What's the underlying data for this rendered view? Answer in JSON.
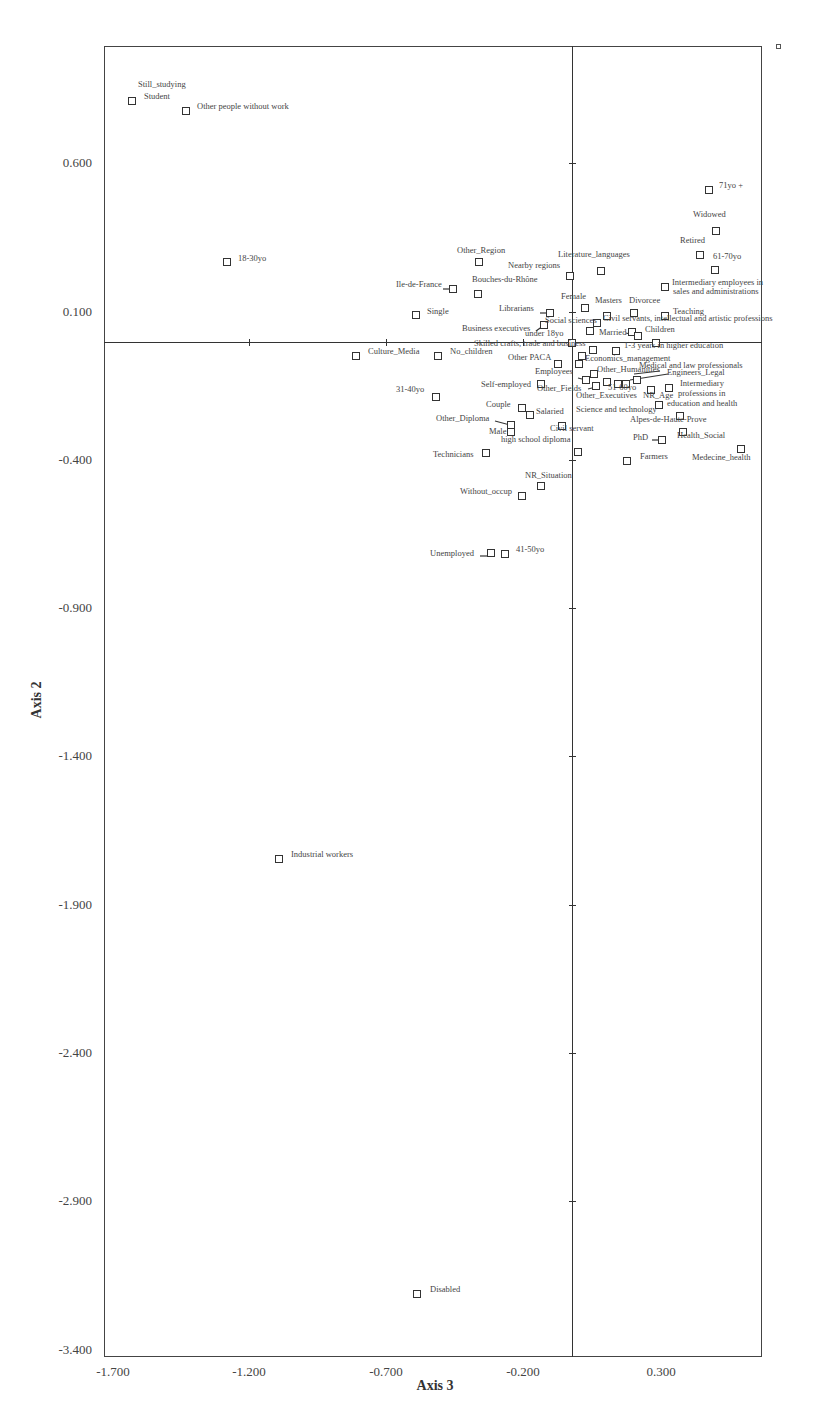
{
  "chart_data": {
    "type": "scatter",
    "title": "",
    "xlabel": "Axis 3",
    "ylabel": "Axis 2",
    "xlim": [
      -1.7,
      0.72
    ],
    "ylim": [
      -3.4,
      1.0
    ],
    "grid": false,
    "legend_position": "none",
    "x_ticks": [
      "-1.700",
      "-1.200",
      "-0.700",
      "-0.200",
      "0.300"
    ],
    "y_ticks": [
      "0.600",
      "0.100",
      "-0.400",
      "-0.900",
      "-1.400",
      "-1.900",
      "-2.400",
      "-2.900",
      "-3.400"
    ],
    "points": [
      {
        "label": "Still_studying",
        "x": -1.62,
        "y": 0.81
      },
      {
        "label": "Student",
        "x": -1.62,
        "y": 0.81
      },
      {
        "label": "Other people without work",
        "x": -1.42,
        "y": 0.77
      },
      {
        "label": "18-30yo",
        "x": -1.26,
        "y": 0.27
      },
      {
        "label": "71yo +",
        "x": 0.53,
        "y": 0.51
      },
      {
        "label": "Widowed",
        "x": 0.55,
        "y": 0.38
      },
      {
        "label": "Retired",
        "x": 0.5,
        "y": 0.29
      },
      {
        "label": "61-70yo",
        "x": 0.55,
        "y": 0.24
      },
      {
        "label": "Intermediary employees in sales and administrations",
        "x": 0.35,
        "y": 0.19
      },
      {
        "label": "Literature_languages",
        "x": 0.1,
        "y": 0.24
      },
      {
        "label": "Nearby regions",
        "x": -0.01,
        "y": 0.22
      },
      {
        "label": "Other_Region",
        "x": -0.35,
        "y": 0.27
      },
      {
        "label": "Ile-de-France",
        "x": -0.45,
        "y": 0.18
      },
      {
        "label": "Bouches-du-Rhône",
        "x": -0.35,
        "y": 0.16
      },
      {
        "label": "Single",
        "x": -0.59,
        "y": 0.09
      },
      {
        "label": "Librarians",
        "x": -0.09,
        "y": 0.1
      },
      {
        "label": "Female",
        "x": 0.04,
        "y": 0.12
      },
      {
        "label": "Masters",
        "x": 0.12,
        "y": 0.09
      },
      {
        "label": "Divorcee",
        "x": 0.23,
        "y": 0.1
      },
      {
        "label": "Teaching",
        "x": 0.35,
        "y": 0.09
      },
      {
        "label": "Social sciences",
        "x": -0.11,
        "y": 0.06
      },
      {
        "label": "Civil servants, intellectual and artistic professions",
        "x": 0.09,
        "y": 0.06
      },
      {
        "label": "Business executives",
        "x": -0.13,
        "y": 0.03
      },
      {
        "label": "under 18yo",
        "x": -0.01,
        "y": 0.0
      },
      {
        "label": "Married",
        "x": 0.07,
        "y": 0.04
      },
      {
        "label": "Children",
        "x": 0.23,
        "y": 0.03
      },
      {
        "label": "Skilled crafts, trade and business",
        "x": -0.01,
        "y": -0.01
      },
      {
        "label": "1-3 years in higher education",
        "x": 0.16,
        "y": -0.03
      },
      {
        "label": "Culture_Media",
        "x": -0.81,
        "y": -0.05
      },
      {
        "label": "No_children",
        "x": -0.5,
        "y": -0.05
      },
      {
        "label": "Other PACA",
        "x": -0.05,
        "y": -0.08
      },
      {
        "label": "Economics_management",
        "x": 0.03,
        "y": -0.08
      },
      {
        "label": "Employees",
        "x": 0.04,
        "y": -0.13
      },
      {
        "label": "Other_Humanities",
        "x": 0.08,
        "y": -0.11
      },
      {
        "label": "Medical and law professionals",
        "x": 0.25,
        "y": -0.12
      },
      {
        "label": "Engineers_Legal",
        "x": 0.24,
        "y": -0.14
      },
      {
        "label": "51-60yo",
        "x": 0.17,
        "y": -0.14
      },
      {
        "label": "Other_Fields",
        "x": 0.09,
        "y": -0.15
      },
      {
        "label": "Self-employed",
        "x": -0.11,
        "y": -0.14
      },
      {
        "label": "Other_Executives",
        "x": 0.13,
        "y": -0.14
      },
      {
        "label": "NR_Age",
        "x": 0.3,
        "y": -0.16
      },
      {
        "label": "Intermediary professions in education and health",
        "x": 0.37,
        "y": -0.15
      },
      {
        "label": "31-40yo",
        "x": -0.52,
        "y": -0.19
      },
      {
        "label": "Couple",
        "x": -0.18,
        "y": -0.22
      },
      {
        "label": "Salaried",
        "x": -0.15,
        "y": -0.24
      },
      {
        "label": "Science and technology",
        "x": 0.32,
        "y": -0.2
      },
      {
        "label": "Alpes-de-Haute-Prove",
        "x": 0.4,
        "y": -0.25
      },
      {
        "label": "Other_Diploma",
        "x": -0.22,
        "y": -0.27
      },
      {
        "label": "Male",
        "x": -0.22,
        "y": -0.3
      },
      {
        "label": "Civil servant",
        "x": -0.04,
        "y": -0.28
      },
      {
        "label": "high school diploma",
        "x": -0.22,
        "y": -0.3
      },
      {
        "label": "PhD",
        "x": 0.33,
        "y": -0.33
      },
      {
        "label": "Health_Social",
        "x": 0.41,
        "y": -0.31
      },
      {
        "label": "Medecine_health",
        "x": 0.62,
        "y": -0.36
      },
      {
        "label": "Technicians",
        "x": -0.32,
        "y": -0.37
      },
      {
        "label": "Farmers",
        "x": 0.2,
        "y": -0.4
      },
      {
        "label": "NR_Situation",
        "x": -0.11,
        "y": -0.48
      },
      {
        "label": "Without_occup",
        "x": -0.18,
        "y": -0.52
      },
      {
        "label": "Unemployed",
        "x": -0.3,
        "y": -0.72
      },
      {
        "label": "41-50yo",
        "x": -0.25,
        "y": -0.72
      },
      {
        "label": "Industrial workers",
        "x": -1.09,
        "y": -1.71
      },
      {
        "label": "Disabled",
        "x": -0.59,
        "y": -3.17
      }
    ]
  },
  "axes": {
    "x_title": "Axis 3",
    "y_title": "Axis 2",
    "x_ticks": [
      {
        "label": "-1.700",
        "px": 113
      },
      {
        "label": "-1.200",
        "px": 249
      },
      {
        "label": "-0.700",
        "px": 386
      },
      {
        "label": "-0.200",
        "px": 523
      },
      {
        "label": "0.300",
        "px": 661
      }
    ],
    "y_ticks": [
      {
        "label": "0.600",
        "py": 163
      },
      {
        "label": "0.100",
        "py": 312
      },
      {
        "label": "-0.400",
        "py": 460
      },
      {
        "label": "-0.900",
        "py": 608
      },
      {
        "label": "-1.400",
        "py": 756
      },
      {
        "label": "-1.900",
        "py": 905
      },
      {
        "label": "-2.400",
        "py": 1053
      },
      {
        "label": "-2.900",
        "py": 1201
      },
      {
        "label": "-3.400",
        "py": 1350
      }
    ]
  },
  "markers": [
    {
      "name": "student",
      "px": 132,
      "py": 101
    },
    {
      "name": "other-people-without-work",
      "px": 186,
      "py": 111
    },
    {
      "name": "18-30yo",
      "px": 227,
      "py": 262
    },
    {
      "name": "71yo",
      "px": 709,
      "py": 190
    },
    {
      "name": "widowed",
      "px": 716,
      "py": 231
    },
    {
      "name": "retired",
      "px": 700,
      "py": 255
    },
    {
      "name": "61-70yo",
      "px": 715,
      "py": 270
    },
    {
      "name": "intermediary-employees",
      "px": 665,
      "py": 287
    },
    {
      "name": "literature-languages",
      "px": 601,
      "py": 271
    },
    {
      "name": "nearby-regions",
      "px": 570,
      "py": 276
    },
    {
      "name": "other-region",
      "px": 479,
      "py": 262
    },
    {
      "name": "ile-de-france",
      "px": 453,
      "py": 289
    },
    {
      "name": "bouches-du-rhone",
      "px": 478,
      "py": 294
    },
    {
      "name": "single",
      "px": 416,
      "py": 315
    },
    {
      "name": "librarians",
      "px": 550,
      "py": 313
    },
    {
      "name": "female",
      "px": 585,
      "py": 308
    },
    {
      "name": "masters",
      "px": 607,
      "py": 316
    },
    {
      "name": "divorcee",
      "px": 634,
      "py": 313
    },
    {
      "name": "teaching",
      "px": 665,
      "py": 316
    },
    {
      "name": "social-sciences",
      "px": 544,
      "py": 325
    },
    {
      "name": "civil-servants-intellectual",
      "px": 597,
      "py": 323
    },
    {
      "name": "civil-servants-2",
      "px": 590,
      "py": 331
    },
    {
      "name": "married",
      "px": 632,
      "py": 332
    },
    {
      "name": "children",
      "px": 638,
      "py": 336
    },
    {
      "name": "under-18yo",
      "px": 572,
      "py": 343
    },
    {
      "name": "skilled-crafts",
      "px": 593,
      "py": 350
    },
    {
      "name": "1-3-years",
      "px": 616,
      "py": 351
    },
    {
      "name": "children-2",
      "px": 656,
      "py": 343
    },
    {
      "name": "culture-media",
      "px": 356,
      "py": 356
    },
    {
      "name": "no-children",
      "px": 438,
      "py": 356
    },
    {
      "name": "economics-management",
      "px": 582,
      "py": 356
    },
    {
      "name": "other-paca",
      "px": 558,
      "py": 364
    },
    {
      "name": "economics-2",
      "px": 579,
      "py": 364
    },
    {
      "name": "other-humanities",
      "px": 594,
      "py": 374
    },
    {
      "name": "employees",
      "px": 586,
      "py": 380
    },
    {
      "name": "other-fields",
      "px": 596,
      "py": 386
    },
    {
      "name": "51-60yo-a",
      "px": 607,
      "py": 382
    },
    {
      "name": "51-60yo-b",
      "px": 618,
      "py": 384
    },
    {
      "name": "51-60yo-c",
      "px": 626,
      "py": 384
    },
    {
      "name": "engineers-legal",
      "px": 637,
      "py": 380
    },
    {
      "name": "self-employed",
      "px": 541,
      "py": 384
    },
    {
      "name": "nr-age",
      "px": 651,
      "py": 390
    },
    {
      "name": "intermediary-professions",
      "px": 669,
      "py": 388
    },
    {
      "name": "science-technology",
      "px": 659,
      "py": 405
    },
    {
      "name": "alpes-de-haute-provence",
      "px": 680,
      "py": 416
    },
    {
      "name": "31-40yo",
      "px": 436,
      "py": 397
    },
    {
      "name": "couple",
      "px": 522,
      "py": 408
    },
    {
      "name": "salaried",
      "px": 530,
      "py": 415
    },
    {
      "name": "other-diploma",
      "px": 511,
      "py": 425
    },
    {
      "name": "male",
      "px": 511,
      "py": 432
    },
    {
      "name": "civil-servant",
      "px": 562,
      "py": 426
    },
    {
      "name": "health-social",
      "px": 683,
      "py": 432
    },
    {
      "name": "phd",
      "px": 662,
      "py": 440
    },
    {
      "name": "medecine-health",
      "px": 741,
      "py": 449
    },
    {
      "name": "technicians",
      "px": 486,
      "py": 453
    },
    {
      "name": "high-school-diploma",
      "px": 578,
      "py": 452
    },
    {
      "name": "farmers",
      "px": 627,
      "py": 461
    },
    {
      "name": "nr-situation",
      "px": 541,
      "py": 486
    },
    {
      "name": "without-occup",
      "px": 522,
      "py": 496
    },
    {
      "name": "unemployed",
      "px": 491,
      "py": 553
    },
    {
      "name": "41-50yo",
      "px": 505,
      "py": 554
    },
    {
      "name": "industrial-workers",
      "px": 279,
      "py": 859
    },
    {
      "name": "disabled",
      "px": 417,
      "py": 1294
    }
  ],
  "labels": [
    {
      "text": "Still_studying",
      "px": 138,
      "py": 84
    },
    {
      "text": "Student",
      "px": 144,
      "py": 96
    },
    {
      "text": "Other people without work",
      "px": 197,
      "py": 106
    },
    {
      "text": "18-30yo",
      "px": 238,
      "py": 258
    },
    {
      "text": "71yo +",
      "px": 719,
      "py": 185
    },
    {
      "text": "Widowed",
      "px": 693,
      "py": 214
    },
    {
      "text": "Retired",
      "px": 680,
      "py": 240
    },
    {
      "text": "61-70yo",
      "px": 713,
      "py": 256
    },
    {
      "text": "Intermediary employees in",
      "px": 672,
      "py": 282
    },
    {
      "text": "sales and administrations",
      "px": 673,
      "py": 291
    },
    {
      "text": "Literature_languages",
      "px": 558,
      "py": 254
    },
    {
      "text": "Nearby regions",
      "px": 508,
      "py": 265
    },
    {
      "text": "Other_Region",
      "px": 457,
      "py": 250
    },
    {
      "text": "Ile-de-France",
      "px": 396,
      "py": 284
    },
    {
      "text": "Bouches-du-Rhône",
      "px": 472,
      "py": 279
    },
    {
      "text": "Single",
      "px": 427,
      "py": 311
    },
    {
      "text": "Librarians",
      "px": 499,
      "py": 308
    },
    {
      "text": "Female",
      "px": 561,
      "py": 296
    },
    {
      "text": "Masters",
      "px": 595,
      "py": 300
    },
    {
      "text": "Divorcee",
      "px": 629,
      "py": 300
    },
    {
      "text": "Teaching",
      "px": 673,
      "py": 311
    },
    {
      "text": "Social sciences",
      "px": 545,
      "py": 320
    },
    {
      "text": "Civil servants, intellectual and artistic professions",
      "px": 603,
      "py": 318
    },
    {
      "text": "Business executives",
      "px": 462,
      "py": 328
    },
    {
      "text": "under 18yo",
      "px": 525,
      "py": 333
    },
    {
      "text": "Married",
      "px": 599,
      "py": 332
    },
    {
      "text": "Children",
      "px": 645,
      "py": 329
    },
    {
      "text": "Skilled crafts, trade and business",
      "px": 474,
      "py": 343
    },
    {
      "text": "1-3 years in higher education",
      "px": 624,
      "py": 345
    },
    {
      "text": "Culture_Media",
      "px": 368,
      "py": 351
    },
    {
      "text": "No_children",
      "px": 450,
      "py": 351
    },
    {
      "text": "Economics_management",
      "px": 585,
      "py": 358
    },
    {
      "text": "Other PACA",
      "px": 508,
      "py": 357
    },
    {
      "text": "Medical and law professionals",
      "px": 639,
      "py": 365
    },
    {
      "text": "Other_Humanities",
      "px": 597,
      "py": 369
    },
    {
      "text": "Employees",
      "px": 535,
      "py": 371
    },
    {
      "text": "Engineers_Legal",
      "px": 667,
      "py": 372
    },
    {
      "text": "Intermediary",
      "px": 680,
      "py": 383
    },
    {
      "text": "Self-employed",
      "px": 481,
      "py": 384
    },
    {
      "text": "Other_Fields",
      "px": 537,
      "py": 388
    },
    {
      "text": "51-60yo",
      "px": 608,
      "py": 387
    },
    {
      "text": "professions in",
      "px": 678,
      "py": 393
    },
    {
      "text": "Other_Executives",
      "px": 576,
      "py": 395
    },
    {
      "text": "NR_Age",
      "px": 643,
      "py": 395
    },
    {
      "text": "education and health",
      "px": 667,
      "py": 403
    },
    {
      "text": "31-40yo",
      "px": 396,
      "py": 389
    },
    {
      "text": "Couple",
      "px": 486,
      "py": 404
    },
    {
      "text": "Salaried",
      "px": 536,
      "py": 411
    },
    {
      "text": "Science and technology",
      "px": 576,
      "py": 409
    },
    {
      "text": "Alpes-de-Haute-Prove",
      "px": 630,
      "py": 419
    },
    {
      "text": "Other_Diploma",
      "px": 436,
      "py": 418
    },
    {
      "text": "Civil servant",
      "px": 550,
      "py": 428
    },
    {
      "text": "Male",
      "px": 489,
      "py": 431
    },
    {
      "text": "high school diploma",
      "px": 501,
      "py": 439
    },
    {
      "text": "PhD",
      "px": 633,
      "py": 437
    },
    {
      "text": "Health_Social",
      "px": 677,
      "py": 435
    },
    {
      "text": "Technicians",
      "px": 433,
      "py": 454
    },
    {
      "text": "Farmers",
      "px": 640,
      "py": 456
    },
    {
      "text": "Medecine_health",
      "px": 692,
      "py": 457
    },
    {
      "text": "NR_Situation",
      "px": 525,
      "py": 475
    },
    {
      "text": "Without_occup",
      "px": 460,
      "py": 491
    },
    {
      "text": "Unemployed",
      "px": 430,
      "py": 553
    },
    {
      "text": "41-50yo",
      "px": 516,
      "py": 549
    },
    {
      "text": "Industrial workers",
      "px": 291,
      "py": 854
    },
    {
      "text": "Disabled",
      "px": 430,
      "py": 1289
    }
  ],
  "leaders": [
    {
      "x1": 443,
      "y1": 289,
      "x2": 451,
      "y2": 289
    },
    {
      "x1": 540,
      "y1": 313,
      "x2": 547,
      "y2": 313
    },
    {
      "x1": 536,
      "y1": 331,
      "x2": 543,
      "y2": 326
    },
    {
      "x1": 626,
      "y1": 333,
      "x2": 638,
      "y2": 336
    },
    {
      "x1": 578,
      "y1": 378,
      "x2": 586,
      "y2": 380
    },
    {
      "x1": 588,
      "y1": 389,
      "x2": 596,
      "y2": 387
    },
    {
      "x1": 495,
      "y1": 421,
      "x2": 510,
      "y2": 425
    },
    {
      "x1": 652,
      "y1": 440,
      "x2": 660,
      "y2": 440
    },
    {
      "x1": 480,
      "y1": 556,
      "x2": 490,
      "y2": 556
    },
    {
      "x1": 634,
      "y1": 374,
      "x2": 660,
      "y2": 371
    },
    {
      "x1": 630,
      "y1": 380,
      "x2": 668,
      "y2": 374
    }
  ],
  "v_ticks_py": [
    163,
    312,
    460,
    608,
    756,
    905,
    1053,
    1201
  ],
  "h_ticks_px": [
    249,
    386,
    523
  ]
}
